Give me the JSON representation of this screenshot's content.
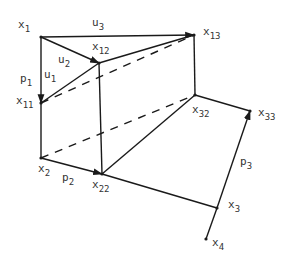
{
  "diagram": {
    "type": "geometric-network",
    "colors": {
      "stroke": "#1a1a1a",
      "label": "#333333",
      "background": "#ffffff"
    },
    "nodes": [
      {
        "id": "x1",
        "base": "x",
        "sub": "1",
        "pos": [
          41,
          37
        ],
        "label_pos": [
          18,
          28
        ]
      },
      {
        "id": "x12",
        "base": "x",
        "sub": "12",
        "pos": [
          99,
          63
        ],
        "label_pos": [
          92,
          50
        ]
      },
      {
        "id": "x13",
        "base": "x",
        "sub": "13",
        "pos": [
          194,
          35
        ],
        "label_pos": [
          203,
          35
        ]
      },
      {
        "id": "x11",
        "base": "x",
        "sub": "11",
        "pos": [
          41,
          103
        ],
        "label_pos": [
          16,
          104
        ]
      },
      {
        "id": "x2",
        "base": "x",
        "sub": "2",
        "pos": [
          41,
          158
        ],
        "label_pos": [
          38,
          172
        ]
      },
      {
        "id": "x22",
        "base": "x",
        "sub": "22",
        "pos": [
          102,
          174
        ],
        "label_pos": [
          92,
          188
        ]
      },
      {
        "id": "x32",
        "base": "x",
        "sub": "32",
        "pos": [
          195,
          95
        ],
        "label_pos": [
          192,
          113
        ]
      },
      {
        "id": "x33",
        "base": "x",
        "sub": "33",
        "pos": [
          250,
          111
        ],
        "label_pos": [
          258,
          116
        ]
      },
      {
        "id": "x3",
        "base": "x",
        "sub": "3",
        "pos": [
          217,
          208
        ],
        "label_pos": [
          228,
          208
        ]
      },
      {
        "id": "x4",
        "base": "x",
        "sub": "4",
        "pos": [
          206,
          239
        ],
        "label_pos": [
          212,
          246
        ]
      }
    ],
    "edge_labels": [
      {
        "id": "u3",
        "base": "u",
        "sub": "3",
        "pos": [
          92,
          26
        ]
      },
      {
        "id": "u2",
        "base": "u",
        "sub": "2",
        "pos": [
          58,
          63
        ]
      },
      {
        "id": "u1",
        "base": "u",
        "sub": "1",
        "pos": [
          44,
          78
        ]
      },
      {
        "id": "p1",
        "base": "p",
        "sub": "1",
        "pos": [
          20,
          82
        ]
      },
      {
        "id": "p2",
        "base": "p",
        "sub": "2",
        "pos": [
          62,
          181
        ]
      },
      {
        "id": "p3",
        "base": "p",
        "sub": "3",
        "pos": [
          240,
          165
        ]
      }
    ],
    "edges": [
      {
        "from": [
          41,
          37
        ],
        "to": [
          194,
          35
        ],
        "style": "solid",
        "arrow": true
      },
      {
        "from": [
          41,
          37
        ],
        "to": [
          99,
          63
        ],
        "style": "solid",
        "arrow": true
      },
      {
        "from": [
          41,
          37
        ],
        "to": [
          41,
          103
        ],
        "style": "solid",
        "arrow": true
      },
      {
        "from": [
          41,
          103
        ],
        "to": [
          99,
          63
        ],
        "style": "solid",
        "arrow": false
      },
      {
        "from": [
          99,
          63
        ],
        "to": [
          194,
          35
        ],
        "style": "solid",
        "arrow": false
      },
      {
        "from": [
          194,
          35
        ],
        "to": [
          195,
          95
        ],
        "style": "solid",
        "arrow": false
      },
      {
        "from": [
          99,
          63
        ],
        "to": [
          102,
          174
        ],
        "style": "solid",
        "arrow": false
      },
      {
        "from": [
          41,
          103
        ],
        "to": [
          41,
          158
        ],
        "style": "solid",
        "arrow": false
      },
      {
        "from": [
          41,
          158
        ],
        "to": [
          102,
          174
        ],
        "style": "solid",
        "arrow": true
      },
      {
        "from": [
          102,
          174
        ],
        "to": [
          195,
          95
        ],
        "style": "solid",
        "arrow": false
      },
      {
        "from": [
          195,
          95
        ],
        "to": [
          250,
          111
        ],
        "style": "solid",
        "arrow": false
      },
      {
        "from": [
          102,
          174
        ],
        "to": [
          217,
          208
        ],
        "style": "solid",
        "arrow": false
      },
      {
        "from": [
          217,
          208
        ],
        "to": [
          250,
          111
        ],
        "style": "solid",
        "arrow": true
      },
      {
        "from": [
          217,
          208
        ],
        "to": [
          206,
          239
        ],
        "style": "solid",
        "arrow": false
      },
      {
        "from": [
          41,
          103
        ],
        "to": [
          194,
          35
        ],
        "style": "dashed",
        "arrow": false
      },
      {
        "from": [
          41,
          158
        ],
        "to": [
          195,
          95
        ],
        "style": "dashed",
        "arrow": false
      }
    ]
  }
}
